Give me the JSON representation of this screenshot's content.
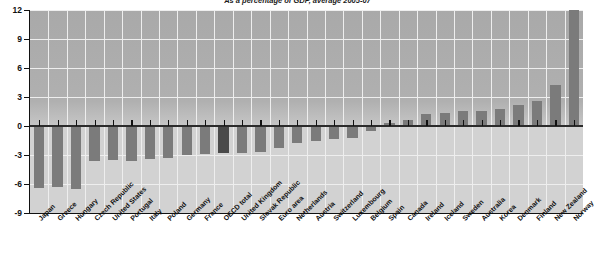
{
  "chart_data": {
    "type": "bar",
    "title": "As a percentage of GDP, average 2005-07",
    "xlabel": "",
    "ylabel": "",
    "ylim": [
      -9,
      12
    ],
    "yticks": [
      12,
      9,
      6,
      3,
      0,
      -3,
      -6,
      -9
    ],
    "grid": true,
    "legend": "none",
    "highlight_category": "OECD total",
    "categories": [
      "Japan",
      "Greece",
      "Hungary",
      "Czech Republic",
      "United States",
      "Portugal",
      "Italy",
      "Poland",
      "Germany",
      "France",
      "OECD total",
      "United Kingdom",
      "Slovak Republic",
      "Euro area",
      "Netherlands",
      "Austria",
      "Switzerland",
      "Luxembourg",
      "Belgium",
      "Spain",
      "Canada",
      "Ireland",
      "Iceland",
      "Sweden",
      "Australia",
      "Korea",
      "Denmark",
      "Finland",
      "New Zealand",
      "Norway"
    ],
    "values": [
      -6.4,
      -6.3,
      -6.5,
      -3.6,
      -3.5,
      -3.6,
      -3.4,
      -3.3,
      -3.0,
      -2.9,
      -2.8,
      -2.8,
      -2.7,
      -2.3,
      -1.8,
      -1.5,
      -1.3,
      -1.2,
      -0.5,
      0.3,
      0.6,
      1.2,
      1.3,
      1.6,
      1.6,
      1.8,
      2.2,
      2.6,
      4.2,
      12.0
    ]
  },
  "axis": {
    "y_tick_labels": [
      "12",
      "9",
      "6",
      "3",
      "0",
      "-3",
      "-6",
      "-9"
    ]
  }
}
